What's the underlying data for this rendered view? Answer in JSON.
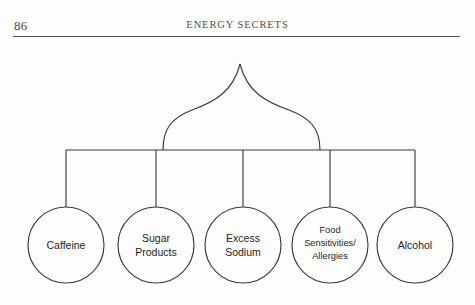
{
  "page": {
    "folio": "86",
    "running_title": "ENERGY SECRETS",
    "background_color": "#fdfdfc",
    "rule_color": "#555555"
  },
  "diagram": {
    "type": "tree",
    "line_color": "#3a3a3a",
    "apex": {
      "x": 240,
      "y": 24,
      "shape": "pointed-arch-curve"
    },
    "connector_bar": {
      "y": 110,
      "x_start": 66,
      "x_end": 415
    },
    "nodes": [
      {
        "id": "caffeine",
        "label_lines": [
          "Caffeine"
        ],
        "cx": 66,
        "cy": 205,
        "r": 38
      },
      {
        "id": "sugar-products",
        "label_lines": [
          "Sugar",
          "Products"
        ],
        "cx": 156,
        "cy": 205,
        "r": 38
      },
      {
        "id": "excess-sodium",
        "label_lines": [
          "Excess",
          "Sodium"
        ],
        "cx": 243,
        "cy": 205,
        "r": 38
      },
      {
        "id": "food-sensitivities-allergies",
        "label_lines": [
          "Food",
          "Sensitivities/",
          "Allergies"
        ],
        "cx": 330,
        "cy": 205,
        "r": 38
      },
      {
        "id": "alcohol",
        "label_lines": [
          "Alcohol"
        ],
        "cx": 415,
        "cy": 205,
        "r": 38
      }
    ]
  }
}
